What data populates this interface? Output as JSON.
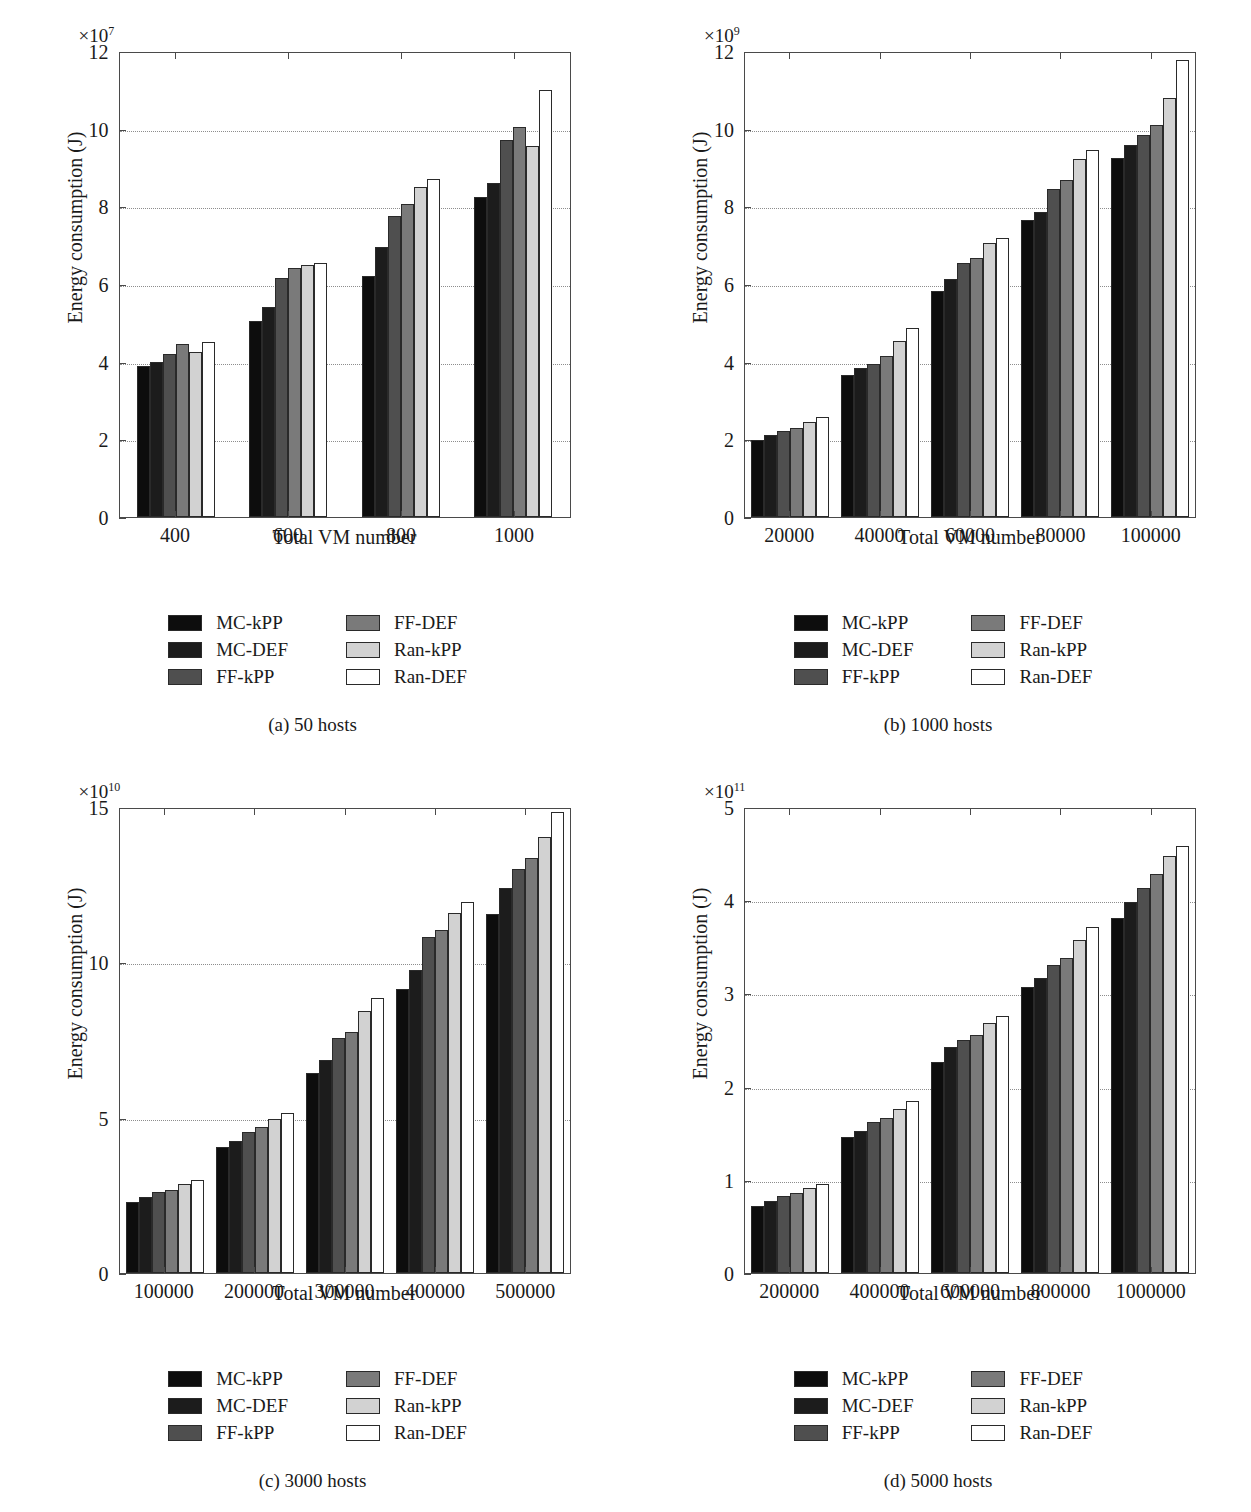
{
  "figure": {
    "series_names": [
      "MC-kPP",
      "MC-DEF",
      "FF-kPP",
      "FF-DEF",
      "Ran-kPP",
      "Ran-DEF"
    ],
    "series_colors": [
      "#0d0d0d",
      "#1c1c1c",
      "#4f4f4f",
      "#7a7a7a",
      "#d2d2d2",
      "#ffffff"
    ],
    "legend_order": [
      "MC-kPP",
      "FF-DEF",
      "MC-DEF",
      "Ran-kPP",
      "FF-kPP",
      "Ran-DEF"
    ],
    "ylabel": "Energy consumption (J)",
    "xlabel": "Total VM number"
  },
  "chart_data": [
    {
      "type": "bar",
      "panel": "a",
      "caption": "(a)  50 hosts",
      "title": "",
      "xlabel": "Total VM number",
      "ylabel": "Energy consumption (J)",
      "exponent_mantissa": "×10",
      "exponent_power": "7",
      "y_scale": 10000000.0,
      "categories": [
        "400",
        "600",
        "800",
        "1000"
      ],
      "yticks": [
        0,
        2,
        4,
        6,
        8,
        10,
        12
      ],
      "ylim": [
        0,
        12
      ],
      "grid": true,
      "legend_position": "below-plot",
      "series": [
        {
          "name": "MC-kPP",
          "values": [
            3.9,
            5.05,
            6.2,
            8.25
          ]
        },
        {
          "name": "MC-DEF",
          "values": [
            4.0,
            5.4,
            6.95,
            8.6
          ]
        },
        {
          "name": "FF-kPP",
          "values": [
            4.2,
            6.15,
            7.75,
            9.7
          ]
        },
        {
          "name": "FF-DEF",
          "values": [
            4.45,
            6.4,
            8.05,
            10.05
          ]
        },
        {
          "name": "Ran-kPP",
          "values": [
            4.25,
            6.5,
            8.5,
            9.55
          ]
        },
        {
          "name": "Ran-DEF",
          "values": [
            4.5,
            6.55,
            8.7,
            11.0
          ]
        }
      ]
    },
    {
      "type": "bar",
      "panel": "b",
      "caption": "(b)  1000 hosts",
      "title": "",
      "xlabel": "Total VM number",
      "ylabel": "Energy consumption (J)",
      "exponent_mantissa": "×10",
      "exponent_power": "9",
      "y_scale": 1000000000.0,
      "categories": [
        "20000",
        "40000",
        "60000",
        "80000",
        "100000"
      ],
      "yticks": [
        0,
        2,
        4,
        6,
        8,
        10,
        12
      ],
      "ylim": [
        0,
        12
      ],
      "grid": true,
      "legend_position": "below-plot",
      "series": [
        {
          "name": "MC-kPP",
          "values": [
            1.98,
            3.65,
            5.82,
            7.65,
            9.25
          ]
        },
        {
          "name": "MC-DEF",
          "values": [
            2.12,
            3.85,
            6.12,
            7.85,
            9.57
          ]
        },
        {
          "name": "FF-kPP",
          "values": [
            2.22,
            3.95,
            6.55,
            8.45,
            9.85
          ]
        },
        {
          "name": "FF-DEF",
          "values": [
            2.28,
            4.15,
            6.68,
            8.68,
            10.1
          ]
        },
        {
          "name": "Ran-kPP",
          "values": [
            2.45,
            4.52,
            7.05,
            9.22,
            10.78
          ]
        },
        {
          "name": "Ran-DEF",
          "values": [
            2.58,
            4.88,
            7.18,
            9.45,
            11.78
          ]
        }
      ]
    },
    {
      "type": "bar",
      "panel": "c",
      "caption": "(c)  3000 hosts",
      "title": "",
      "xlabel": "Total VM number",
      "ylabel": "Energy consumption (J)",
      "exponent_mantissa": "×10",
      "exponent_power": "10",
      "y_scale": 10000000000.0,
      "categories": [
        "100000",
        "200000",
        "300000",
        "400000",
        "500000"
      ],
      "yticks": [
        0,
        5,
        10,
        15
      ],
      "ylim": [
        0,
        15
      ],
      "grid": true,
      "legend_position": "below-plot",
      "series": [
        {
          "name": "MC-kPP",
          "values": [
            2.3,
            4.05,
            6.45,
            9.15,
            11.55
          ]
        },
        {
          "name": "MC-DEF",
          "values": [
            2.45,
            4.25,
            6.85,
            9.75,
            12.4
          ]
        },
        {
          "name": "FF-kPP",
          "values": [
            2.6,
            4.55,
            7.55,
            10.8,
            13.0
          ]
        },
        {
          "name": "FF-DEF",
          "values": [
            2.68,
            4.7,
            7.75,
            11.05,
            13.35
          ]
        },
        {
          "name": "Ran-kPP",
          "values": [
            2.85,
            4.95,
            8.45,
            11.6,
            14.05
          ]
        },
        {
          "name": "Ran-DEF",
          "values": [
            2.98,
            5.15,
            8.85,
            11.95,
            14.85
          ]
        }
      ]
    },
    {
      "type": "bar",
      "panel": "d",
      "caption": "(d)  5000 hosts",
      "title": "",
      "xlabel": "Total VM number",
      "ylabel": "Energy consumption (J)",
      "exponent_mantissa": "×10",
      "exponent_power": "11",
      "y_scale": 100000000000.0,
      "categories": [
        "200000",
        "400000",
        "600000",
        "800000",
        "1000000"
      ],
      "yticks": [
        0,
        1,
        2,
        3,
        4,
        5
      ],
      "ylim": [
        0,
        5
      ],
      "grid": true,
      "legend_position": "below-plot",
      "series": [
        {
          "name": "MC-kPP",
          "values": [
            0.72,
            1.46,
            2.26,
            3.07,
            3.81
          ]
        },
        {
          "name": "MC-DEF",
          "values": [
            0.77,
            1.52,
            2.42,
            3.17,
            3.98
          ]
        },
        {
          "name": "FF-kPP",
          "values": [
            0.83,
            1.62,
            2.5,
            3.31,
            4.13
          ]
        },
        {
          "name": "FF-DEF",
          "values": [
            0.86,
            1.66,
            2.55,
            3.38,
            4.28
          ]
        },
        {
          "name": "Ran-kPP",
          "values": [
            0.91,
            1.76,
            2.68,
            3.57,
            4.47
          ]
        },
        {
          "name": "Ran-DEF",
          "values": [
            0.96,
            1.85,
            2.76,
            3.71,
            4.58
          ]
        }
      ]
    }
  ]
}
